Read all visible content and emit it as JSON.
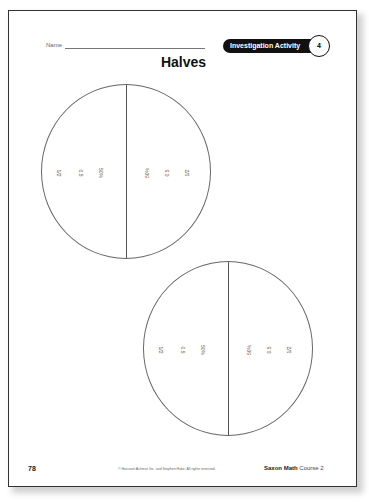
{
  "header": {
    "name_label": "Name",
    "badge_label": "Investigation Activity",
    "badge_number": "4",
    "title": "Halves"
  },
  "circles": [
    {
      "left_labels": [
        "1/2",
        "0.5",
        "50%"
      ],
      "right_labels": [
        "50%",
        "0.5",
        "1/2"
      ]
    },
    {
      "left_labels": [
        "1/2",
        "0.5",
        "50%"
      ],
      "right_labels": [
        "50%",
        "0.5",
        "1/2"
      ]
    }
  ],
  "footer": {
    "page_number": "78",
    "copyright": "© Harcourt Achieve Inc. and Stephen Hake. All rights reserved.",
    "brand": "Saxon Math",
    "course": "Course 2"
  }
}
